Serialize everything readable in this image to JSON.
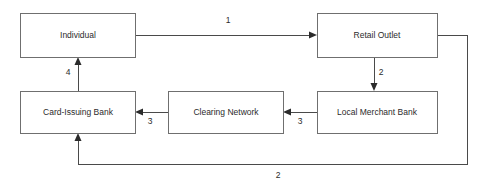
{
  "diagram": {
    "background_color": "#ffffff",
    "box_border_color": "#6f6f6f",
    "line_color": "#4a4a4a",
    "text_color": "#2b2b2b",
    "nodes": [
      {
        "id": "individual",
        "label": "Individual",
        "x": 20,
        "y": 13,
        "w": 115,
        "h": 44
      },
      {
        "id": "retail_outlet",
        "label": "Retail Outlet",
        "x": 317,
        "y": 13,
        "w": 120,
        "h": 44
      },
      {
        "id": "card_issuing_bank",
        "label": "Card-Issuing Bank",
        "x": 20,
        "y": 91,
        "w": 115,
        "h": 42
      },
      {
        "id": "clearing_network",
        "label": "Clearing Network",
        "x": 168,
        "y": 91,
        "w": 115,
        "h": 42
      },
      {
        "id": "local_merchant_bank",
        "label": "Local Merchant Bank",
        "x": 317,
        "y": 91,
        "w": 120,
        "h": 42
      }
    ],
    "edges": [
      {
        "id": "e1",
        "label": "1",
        "from": "individual",
        "to": "retail_outlet",
        "label_x": 228,
        "label_y": 21
      },
      {
        "id": "e2",
        "label": "2",
        "from": "retail_outlet",
        "to": "local_merchant_bank",
        "label_x": 381,
        "label_y": 73
      },
      {
        "id": "e3",
        "label": "3",
        "from": "local_merchant_bank",
        "to": "clearing_network",
        "label_x": 300,
        "label_y": 122
      },
      {
        "id": "e4",
        "label": "3",
        "from": "clearing_network",
        "to": "card_issuing_bank",
        "label_x": 150,
        "label_y": 122
      },
      {
        "id": "e5",
        "label": "4",
        "from": "card_issuing_bank",
        "to": "individual",
        "label_x": 68,
        "label_y": 73
      },
      {
        "id": "e6",
        "label": "2",
        "from": "retail_outlet",
        "to": "card_issuing_bank",
        "label_x": 278,
        "label_y": 176
      }
    ]
  }
}
